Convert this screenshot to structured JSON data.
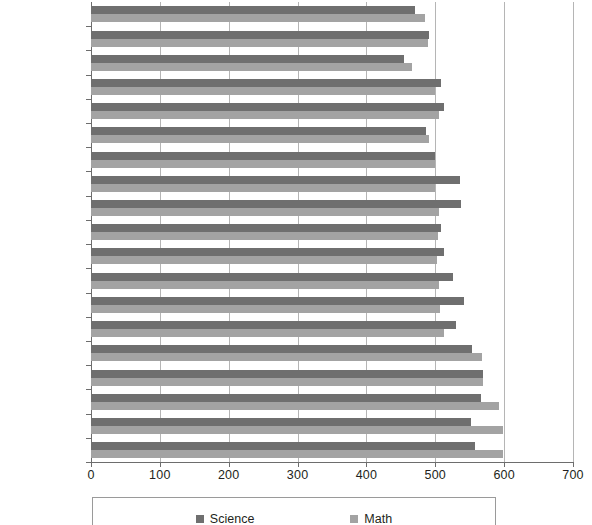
{
  "chart_data": {
    "type": "bar",
    "orientation": "horizontal",
    "title": "",
    "xlabel": "",
    "ylabel": "",
    "xlim": [
      0,
      700
    ],
    "xticks": [
      0,
      100,
      200,
      300,
      400,
      500,
      600,
      700
    ],
    "grid": true,
    "legend_position": "bottom",
    "categories": [
      "Serbia",
      "",
      "Malta",
      "",
      "Australia",
      "",
      "TIMSS Average",
      "",
      "Czech Republic",
      "",
      "United States",
      "",
      "England",
      "",
      "Japan",
      "",
      "Singapore",
      "",
      "Chinese Taipei"
    ],
    "series": [
      {
        "name": "Science",
        "color": "#6f6f6f",
        "values": [
          470,
          491,
          455,
          509,
          512,
          486,
          499,
          536,
          538,
          508,
          512,
          525,
          541,
          530,
          554,
          570,
          567,
          552,
          558
        ]
      },
      {
        "name": "Math",
        "color": "#a3a3a3",
        "values": [
          485,
          489,
          466,
          500,
          505,
          491,
          500,
          500,
          505,
          504,
          502,
          505,
          507,
          513,
          568,
          570,
          593,
          599,
          598
        ]
      }
    ]
  },
  "axis": {
    "x_tick_labels": [
      "0",
      "100",
      "200",
      "300",
      "400",
      "500",
      "600",
      "700"
    ],
    "y_tick_labels": [
      "Serbia",
      "Malta",
      "Australia",
      "TIMSS Average",
      "Czech Republic",
      "United States",
      "England",
      "Japan",
      "Singapore",
      "Chinese Taipei"
    ]
  },
  "legend": {
    "items": [
      {
        "label": "Science",
        "color": "#6f6f6f",
        "swatch": "square-swatch-dark"
      },
      {
        "label": "Math",
        "color": "#a3a3a3",
        "swatch": "square-swatch-light"
      }
    ]
  }
}
